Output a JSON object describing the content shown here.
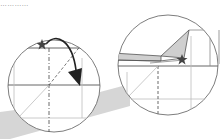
{
  "diagram": {
    "type": "origami-fold-instructions",
    "cutoff_text": "…………",
    "colors": {
      "background": "#ffffff",
      "line": "#555555",
      "light_line": "#bdbdbd",
      "shade": "#cfcfcf",
      "star": "#444444",
      "arrow": "#222222"
    },
    "panels": [
      {
        "id": "left",
        "description": "Magnified circle: star on horizontal crease, curved arrow folding point down along diagonal",
        "markers": [
          "star",
          "curved-arrow"
        ]
      },
      {
        "id": "right",
        "description": "Magnified circle: result with shaded flap and star at fold point",
        "markers": [
          "star",
          "shaded-flap"
        ]
      }
    ]
  }
}
